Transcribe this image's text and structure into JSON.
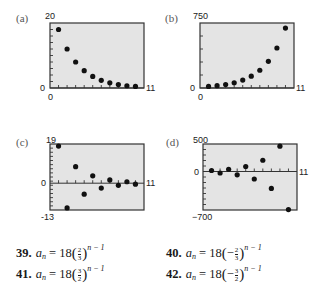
{
  "panels": [
    {
      "label": "(a)",
      "ymax_label": "20",
      "ymin_label": "0",
      "xmin_label": "0",
      "xmax_label": "11"
    },
    {
      "label": "(b)",
      "ymax_label": "750",
      "ymin_label": "0",
      "xmin_label": "0",
      "xmax_label": "11"
    },
    {
      "label": "(c)",
      "ymax_label": "19",
      "zero_label": "0",
      "ymin_label": "-13",
      "xmax_label": "11"
    },
    {
      "label": "(d)",
      "ymax_label": "500",
      "zero_label": "0",
      "ymin_label": "−700",
      "xmax_label": "11"
    }
  ],
  "equations": [
    {
      "num": "39.",
      "lhs": "a",
      "sub": "n",
      "eq": " = 18",
      "sign": "",
      "numer": "2",
      "denom": "3",
      "exp": "n − 1"
    },
    {
      "num": "40.",
      "lhs": "a",
      "sub": "n",
      "eq": " = 18",
      "sign": "−",
      "numer": "2",
      "denom": "3",
      "exp": "n − 1"
    },
    {
      "num": "41.",
      "lhs": "a",
      "sub": "n",
      "eq": " = 18",
      "sign": "",
      "numer": "3",
      "denom": "2",
      "exp": "n − 1"
    },
    {
      "num": "42.",
      "lhs": "a",
      "sub": "n",
      "eq": " = 18",
      "sign": "−",
      "numer": "3",
      "denom": "2",
      "exp": "n − 1"
    }
  ],
  "colors": {
    "plot_bg": "#e4e4e4",
    "frame": "#333333",
    "dot": "#111111"
  },
  "chart_data": [
    {
      "type": "scatter",
      "title": "(a)",
      "x": [
        1,
        2,
        3,
        4,
        5,
        6,
        7,
        8,
        9,
        10
      ],
      "values": [
        18,
        12,
        8,
        5.33,
        3.56,
        2.37,
        1.58,
        1.05,
        0.7,
        0.47
      ],
      "xlim": [
        0,
        11
      ],
      "ylim": [
        0,
        20
      ],
      "xlabel": "",
      "ylabel": "",
      "grid": false
    },
    {
      "type": "scatter",
      "title": "(b)",
      "x": [
        1,
        2,
        3,
        4,
        5,
        6,
        7,
        8,
        9,
        10
      ],
      "values": [
        18,
        27,
        40.5,
        60.75,
        91.1,
        136.7,
        205.0,
        307.5,
        461.3,
        692.0
      ],
      "xlim": [
        0,
        11
      ],
      "ylim": [
        0,
        750
      ],
      "xlabel": "",
      "ylabel": "",
      "grid": false
    },
    {
      "type": "scatter",
      "title": "(c)",
      "x": [
        1,
        2,
        3,
        4,
        5,
        6,
        7,
        8,
        9,
        10
      ],
      "values": [
        18,
        -12,
        8,
        -5.33,
        3.56,
        -2.37,
        1.58,
        -1.05,
        0.7,
        -0.47
      ],
      "xlim": [
        0,
        11
      ],
      "ylim": [
        -13,
        19
      ],
      "xlabel": "",
      "ylabel": "",
      "grid": false
    },
    {
      "type": "scatter",
      "title": "(d)",
      "x": [
        1,
        2,
        3,
        4,
        5,
        6,
        7,
        8,
        9,
        10
      ],
      "values": [
        18,
        -27,
        40.5,
        -60.75,
        91.1,
        -136.7,
        205.0,
        -307.5,
        461.3,
        -692.0
      ],
      "xlim": [
        0,
        11
      ],
      "ylim": [
        -700,
        500
      ],
      "xlabel": "",
      "ylabel": "",
      "grid": false
    }
  ]
}
